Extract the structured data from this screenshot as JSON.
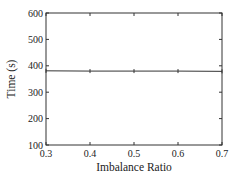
{
  "chart_data": {
    "type": "line",
    "title": "",
    "xlabel": "Imbalance Ratio",
    "ylabel": "Time (s)",
    "xlim": [
      0.3,
      0.7
    ],
    "ylim": [
      100,
      600
    ],
    "xticks": [
      "0.3",
      "0.4",
      "0.5",
      "0.6",
      "0.7"
    ],
    "yticks": [
      "100",
      "200",
      "300",
      "400",
      "500",
      "600"
    ],
    "grid": false,
    "legend": null,
    "series": [
      {
        "name": "time",
        "x": [
          0.3,
          0.4,
          0.5,
          0.6,
          0.7
        ],
        "values": [
          381,
          380,
          380,
          380,
          379
        ]
      }
    ]
  }
}
